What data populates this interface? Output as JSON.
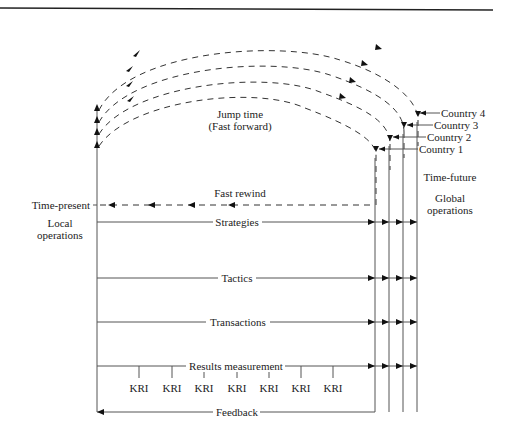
{
  "diagram": {
    "left_axis": {
      "time_label": "Time-present",
      "ops_label_line1": "Local",
      "ops_label_line2": "operations"
    },
    "right_axis": {
      "time_label": "Time-future",
      "ops_label_line1": "Global",
      "ops_label_line2": "operations"
    },
    "jump": {
      "line1": "Jump time",
      "line2": "(Fast forward)"
    },
    "rewind_label": "Fast rewind",
    "countries": [
      "Country 1",
      "Country 2",
      "Country 3",
      "Country 4"
    ],
    "flows": [
      "Strategies",
      "Tactics",
      "Transactions",
      "Results measurement"
    ],
    "kri_label": "KRI",
    "kri_count": 7,
    "feedback_label": "Feedback",
    "colors": {
      "line": "#555555",
      "arrow": "#111111",
      "text": "#222222"
    }
  }
}
